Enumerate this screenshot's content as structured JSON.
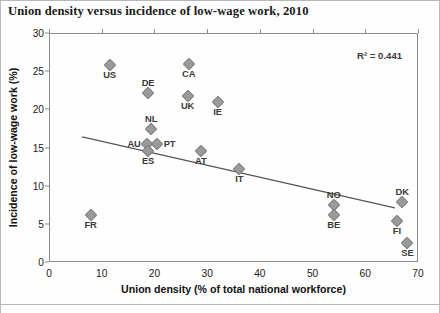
{
  "chart_data": {
    "type": "scatter",
    "title": "Union density versus incidence of low-wage work, 2010",
    "xlabel": "Union density (% of total national workforce)",
    "ylabel": "Incidence of low-wage work (%)",
    "xlim": [
      0,
      70
    ],
    "ylim": [
      0,
      30
    ],
    "xticks": [
      0,
      10,
      20,
      30,
      40,
      50,
      60,
      70
    ],
    "yticks": [
      0,
      5,
      10,
      15,
      20,
      25,
      30
    ],
    "grid": false,
    "legend": null,
    "annotations": [
      {
        "name": "r2-annotation",
        "text": "R² = 0.441",
        "r2": 0.441
      }
    ],
    "trendline": {
      "type": "linear",
      "x_start": 6.3,
      "y_start": 16.4,
      "x_end": 65.6,
      "y_end": 7.1
    },
    "points": [
      {
        "label": "US",
        "x": 11.5,
        "y": 25.8,
        "label_pos": "below"
      },
      {
        "label": "DE",
        "x": 18.8,
        "y": 22.1,
        "label_pos": "above"
      },
      {
        "label": "CA",
        "x": 26.5,
        "y": 26.0,
        "label_pos": "below"
      },
      {
        "label": "UK",
        "x": 26.3,
        "y": 21.8,
        "label_pos": "below"
      },
      {
        "label": "IE",
        "x": 32.0,
        "y": 20.9,
        "label_pos": "below"
      },
      {
        "label": "NL",
        "x": 19.4,
        "y": 17.4,
        "label_pos": "above"
      },
      {
        "label": "AU",
        "x": 18.6,
        "y": 15.4,
        "label_pos": "left"
      },
      {
        "label": "PT",
        "x": 20.4,
        "y": 15.4,
        "label_pos": "right"
      },
      {
        "label": "ES",
        "x": 18.8,
        "y": 14.6,
        "label_pos": "below"
      },
      {
        "label": "AT",
        "x": 28.8,
        "y": 14.6,
        "label_pos": "below"
      },
      {
        "label": "IT",
        "x": 36.1,
        "y": 12.2,
        "label_pos": "below"
      },
      {
        "label": "FR",
        "x": 7.9,
        "y": 6.1,
        "label_pos": "below"
      },
      {
        "label": "NO",
        "x": 54.0,
        "y": 7.5,
        "label_pos": "above"
      },
      {
        "label": "BE",
        "x": 54.0,
        "y": 6.2,
        "label_pos": "below"
      },
      {
        "label": "DK",
        "x": 67.0,
        "y": 7.8,
        "label_pos": "above"
      },
      {
        "label": "FI",
        "x": 66.0,
        "y": 5.4,
        "label_pos": "below"
      },
      {
        "label": "SE",
        "x": 68.0,
        "y": 2.5,
        "label_pos": "below"
      }
    ]
  },
  "colors": {
    "marker": "#9a9a9a",
    "axis": "#8a8a8a",
    "text": "#1a1a1a",
    "trendline": "#55545a"
  }
}
